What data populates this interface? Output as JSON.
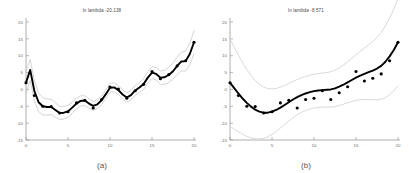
{
  "figure": {
    "background": "#ffffff",
    "panel_count": 2
  },
  "chart_data": [
    {
      "type": "scatter",
      "panel_id": "a",
      "caption": "(a)",
      "title": "ln lambda -20.138",
      "xlabel": "",
      "ylabel": "",
      "xlim": [
        0,
        20
      ],
      "ylim": [
        -15,
        20
      ],
      "xticks": [
        0,
        5,
        10,
        15,
        20
      ],
      "yticks": [
        -15,
        -10,
        -5,
        0,
        5,
        10,
        15,
        20
      ],
      "xtick_labels": [
        "0",
        "5",
        "10",
        "15",
        "20"
      ],
      "ytick_labels": [
        "-15",
        "-10",
        "-5",
        "0",
        "5",
        "10",
        "15",
        "20"
      ],
      "grid": false,
      "legend": "none",
      "colors": {
        "points": "#000000",
        "fit_line": "#000000",
        "confidence_band": "#cfcfcf",
        "axis": "#9a9a9a",
        "tick_text": "#6a6a6a",
        "title_text": "#4a4a4a"
      },
      "series": [
        {
          "name": "observations",
          "marker": "filled-circle",
          "x": [
            0,
            1,
            2,
            3,
            4,
            5,
            6,
            7,
            8,
            9,
            10,
            11,
            12,
            13,
            14,
            15,
            16,
            17,
            18,
            19,
            20
          ],
          "y": [
            2.0,
            -1.8,
            -5.0,
            -5.1,
            -7.0,
            -6.6,
            -4.0,
            -3.2,
            -5.5,
            -3.0,
            0.7,
            0.1,
            -2.6,
            -0.4,
            1.5,
            5.3,
            3.2,
            4.4,
            7.0,
            8.5,
            14.0
          ]
        },
        {
          "name": "smoothing-spline-fit",
          "style": "solid-thick",
          "x": [
            0,
            0.5,
            1,
            1.5,
            2,
            2.5,
            3,
            3.5,
            4,
            4.5,
            5,
            5.5,
            6,
            6.5,
            7,
            7.5,
            8,
            8.5,
            9,
            9.5,
            10,
            10.5,
            11,
            11.5,
            12,
            12.5,
            13,
            13.5,
            14,
            14.5,
            15,
            15.5,
            16,
            16.5,
            17,
            17.5,
            18,
            18.5,
            19,
            19.5,
            20
          ],
          "y": [
            2.0,
            5.8,
            -0.5,
            -3.8,
            -5.0,
            -5.2,
            -5.2,
            -6.1,
            -7.0,
            -6.9,
            -6.5,
            -5.4,
            -4.2,
            -3.4,
            -3.3,
            -4.2,
            -4.9,
            -4.4,
            -3.2,
            -1.4,
            0.5,
            0.6,
            -0.2,
            -1.5,
            -2.4,
            -1.7,
            -0.3,
            0.6,
            1.6,
            3.5,
            5.0,
            4.6,
            3.5,
            3.6,
            4.3,
            5.4,
            7.0,
            8.3,
            8.4,
            10.5,
            14.0
          ]
        },
        {
          "name": "upper-confidence-band",
          "style": "thin-gray",
          "offset": 1.3
        },
        {
          "name": "lower-confidence-band",
          "style": "thin-gray",
          "offset": -1.3
        }
      ]
    },
    {
      "type": "scatter",
      "panel_id": "b",
      "caption": "(b)",
      "title": "ln lambda -8.571",
      "xlabel": "",
      "ylabel": "",
      "xlim": [
        0,
        20
      ],
      "ylim": [
        -15,
        20
      ],
      "xticks": [
        0,
        5,
        10,
        15,
        20
      ],
      "yticks": [
        -15,
        -10,
        -5,
        0,
        5,
        10,
        15,
        20
      ],
      "xtick_labels": [
        "0",
        "5",
        "10",
        "15",
        "20"
      ],
      "ytick_labels": [
        "-15",
        "-10",
        "-5",
        "0",
        "5",
        "10",
        "15",
        "20"
      ],
      "grid": false,
      "legend": "none",
      "colors": {
        "points": "#000000",
        "fit_line": "#000000",
        "confidence_band": "#d5d5d5",
        "axis": "#9a9a9a",
        "tick_text": "#6a6a6a",
        "title_text": "#4a4a4a"
      },
      "series": [
        {
          "name": "observations",
          "marker": "filled-circle",
          "x": [
            0,
            1,
            2,
            3,
            4,
            5,
            6,
            7,
            8,
            9,
            10,
            11,
            12,
            13,
            14,
            15,
            16,
            17,
            18,
            19,
            20
          ],
          "y": [
            2.0,
            -1.8,
            -5.0,
            -5.1,
            -7.0,
            -6.6,
            -4.0,
            -3.2,
            -5.5,
            -3.0,
            -2.6,
            -0.4,
            -3.0,
            -1.0,
            0.8,
            5.3,
            2.5,
            3.3,
            4.6,
            8.5,
            14.0
          ]
        },
        {
          "name": "smoothing-spline-fit",
          "style": "solid-thick",
          "x": [
            0,
            0.5,
            1,
            1.5,
            2,
            2.5,
            3,
            3.5,
            4,
            4.5,
            5,
            5.5,
            6,
            6.5,
            7,
            7.5,
            8,
            8.5,
            9,
            9.5,
            10,
            10.5,
            11,
            11.5,
            12,
            12.5,
            13,
            13.5,
            14,
            14.5,
            15,
            15.5,
            16,
            16.5,
            17,
            17.5,
            18,
            18.5,
            19,
            19.5,
            20
          ],
          "y": [
            2.0,
            0.4,
            -1.2,
            -2.7,
            -4.0,
            -5.1,
            -6.0,
            -6.6,
            -6.9,
            -6.9,
            -6.6,
            -6.1,
            -5.4,
            -4.6,
            -3.8,
            -3.0,
            -2.3,
            -1.7,
            -1.2,
            -0.8,
            -0.5,
            -0.3,
            -0.2,
            -0.1,
            0.0,
            0.3,
            0.8,
            1.4,
            2.1,
            2.8,
            3.5,
            4.1,
            4.6,
            5.1,
            5.6,
            6.2,
            7.0,
            8.2,
            9.8,
            11.7,
            14.0
          ]
        },
        {
          "name": "upper-confidence-band",
          "style": "thin-gray",
          "offset": 5.0
        },
        {
          "name": "lower-confidence-band",
          "style": "thin-gray",
          "offset": -5.0
        }
      ]
    }
  ]
}
